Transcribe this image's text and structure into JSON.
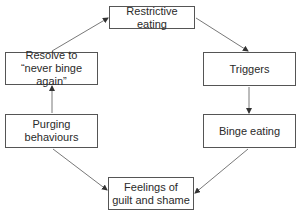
{
  "diagram": {
    "type": "cycle-flowchart",
    "nodes": [
      {
        "id": "restrictive",
        "label": "Restrictive eating"
      },
      {
        "id": "triggers",
        "label": "Triggers"
      },
      {
        "id": "binge",
        "label": "Binge eating"
      },
      {
        "id": "guilt",
        "label": "Feelings of\nguilt and shame"
      },
      {
        "id": "purging",
        "label": "Purging behaviours"
      },
      {
        "id": "resolve",
        "label": "Resolve to\n“never binge again”"
      }
    ],
    "edges": [
      {
        "from": "restrictive",
        "to": "triggers"
      },
      {
        "from": "triggers",
        "to": "binge"
      },
      {
        "from": "binge",
        "to": "guilt"
      },
      {
        "from": "purging",
        "to": "guilt"
      },
      {
        "from": "purging",
        "to": "resolve"
      },
      {
        "from": "resolve",
        "to": "restrictive"
      }
    ],
    "colors": {
      "line": "#555555",
      "text": "#2a2a2a",
      "background": "#ffffff"
    }
  }
}
